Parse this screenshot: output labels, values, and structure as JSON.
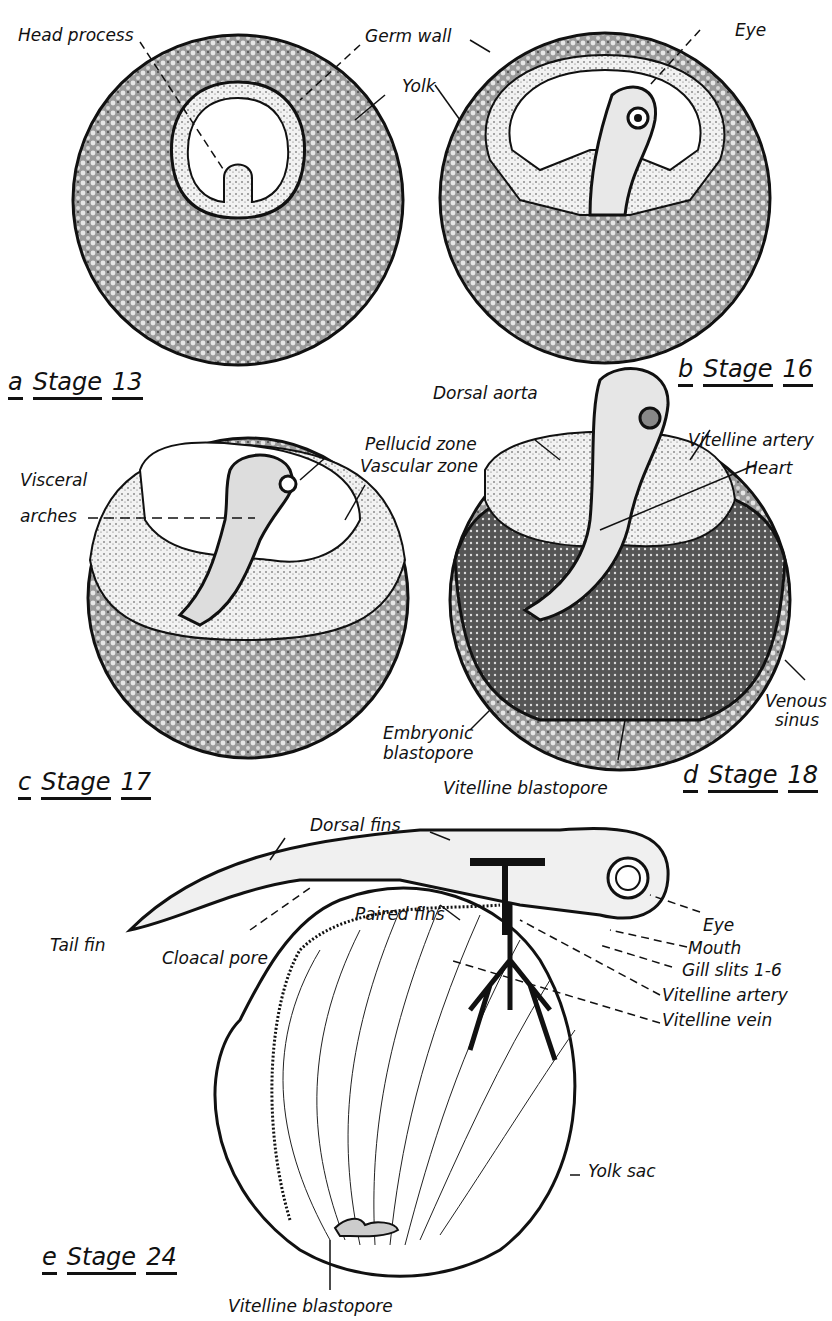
{
  "panels": [
    {
      "letter": "a",
      "stage": "Stage",
      "number": "13"
    },
    {
      "letter": "b",
      "stage": "Stage",
      "number": "16"
    },
    {
      "letter": "c",
      "stage": "Stage",
      "number": "17"
    },
    {
      "letter": "d",
      "stage": "Stage",
      "number": "18"
    },
    {
      "letter": "e",
      "stage": "Stage",
      "number": "24"
    }
  ],
  "labels": {
    "head_process": "Head process",
    "germ_wall": "Germ wall",
    "yolk": "Yolk",
    "eye_b": "Eye",
    "dorsal_aorta": "Dorsal aorta",
    "pellucid_zone": "Pellucid zone",
    "vascular_zone": "Vascular zone",
    "visceral": "Visceral",
    "arches": "arches",
    "vitelline_artery_d": "Vitelline artery",
    "heart": "Heart",
    "venous": "Venous",
    "sinus": "sinus",
    "embryonic": "Embryonic",
    "blastopore": "blastopore",
    "vitelline_blastopore_d": "Vitelline blastopore",
    "dorsal_fins": "Dorsal fins",
    "paired_fins": "Paired fins",
    "tail_fin": "Tail fin",
    "cloacal_pore": "Cloacal pore",
    "eye_e": "Eye",
    "mouth": "Mouth",
    "gill_slits": "Gill slits 1-6",
    "vitelline_artery_e": "Vitelline artery",
    "vitelline_vein": "Vitelline vein",
    "yolk_sac": "Yolk sac",
    "vitelline_blastopore_e": "Vitelline blastopore"
  }
}
